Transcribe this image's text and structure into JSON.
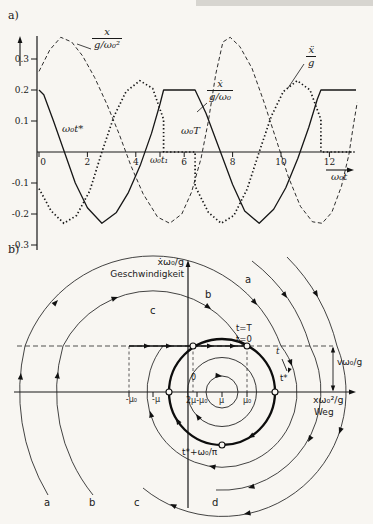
{
  "panel_a": {
    "tag": "a)",
    "curve1": {
      "num": "x",
      "den": "g/ω₀²"
    },
    "curve2": {
      "num": "ẋ",
      "den": "g/ω₀"
    },
    "curve3": {
      "num": "ẍ",
      "den": "g"
    },
    "t_star": "ω₀t*",
    "period": "ω₀T",
    "t1": "ω₀t₁",
    "time_axis": "ω₀t"
  },
  "panel_b": {
    "tag": "b)",
    "v_axis": "ẋω₀/g",
    "v_axis_word": "Geschwindigkeit",
    "x_axis": "xω₀²/g",
    "x_axis_word": "Weg",
    "v_level": "vω₀/g",
    "t_T": "t=T",
    "t_0": "t=0",
    "t_dir": "t",
    "t_star": "t*",
    "t_half": "t*+ω₀/π",
    "origin": "0",
    "x_ticks": {
      "m_mu0": "-μ₀",
      "m_mu": "-μ",
      "two_mu": "2μ-μ₀",
      "mu": "μ",
      "mu0": "μ₀"
    },
    "letters_top": [
      "a",
      "b",
      "c"
    ],
    "letters_bottom": [
      "a",
      "b",
      "c",
      "d"
    ]
  },
  "chart_data": [
    {
      "id": "a",
      "type": "line",
      "title": "Time histories of displacement, velocity and acceleration of a stick-slip friction oscillator",
      "x_axis": {
        "label": "ω₀t",
        "ticks": [
          0,
          2,
          4,
          6,
          8,
          10,
          12
        ],
        "range": [
          0,
          13.2
        ]
      },
      "y_axis": {
        "ticks": [
          0.3,
          0.2,
          0.1,
          -0.1,
          -0.2,
          -0.3
        ],
        "range": [
          -0.3,
          0.38
        ]
      },
      "annotations": {
        "t_star": "ω₀t*",
        "period": "ω₀T",
        "t1": "ω₀t₁",
        "t1_x": 5.0
      },
      "leaders": [
        [
          91,
          49,
          77,
          44
        ],
        [
          207,
          103,
          197,
          112
        ],
        [
          304,
          64,
          288,
          88
        ]
      ],
      "series": [
        {
          "name": "x/(g/ω₀²)",
          "style": "dashed",
          "points": [
            [
              0,
              0.26
            ],
            [
              0.45,
              0.33
            ],
            [
              0.9,
              0.37
            ],
            [
              1.35,
              0.355
            ],
            [
              1.8,
              0.31
            ],
            [
              2.3,
              0.24
            ],
            [
              2.8,
              0.155
            ],
            [
              3.3,
              0.06
            ],
            [
              3.8,
              -0.045
            ],
            [
              4.3,
              -0.135
            ],
            [
              4.9,
              -0.21
            ],
            [
              5.4,
              -0.23
            ],
            [
              5.9,
              -0.2
            ],
            [
              6.3,
              -0.13
            ],
            [
              6.7,
              -0.02
            ],
            [
              7.0,
              0.1
            ],
            [
              7.3,
              0.25
            ],
            [
              7.6,
              0.355
            ],
            [
              7.9,
              0.37
            ],
            [
              8.3,
              0.34
            ],
            [
              8.8,
              0.27
            ],
            [
              9.3,
              0.16
            ],
            [
              9.8,
              0.04
            ],
            [
              10.3,
              -0.08
            ],
            [
              10.8,
              -0.175
            ],
            [
              11.3,
              -0.225
            ],
            [
              11.7,
              -0.23
            ],
            [
              12.1,
              -0.195
            ],
            [
              12.5,
              -0.11
            ],
            [
              12.8,
              -0.01
            ],
            [
              13.0,
              0.09
            ],
            [
              13.15,
              0.16
            ]
          ]
        },
        {
          "name": "ẋ/(g/ω₀)",
          "style": "solid",
          "points": [
            [
              0,
              0.2
            ],
            [
              0.2,
              0.185
            ],
            [
              0.6,
              0.1
            ],
            [
              1.05,
              0.0
            ],
            [
              1.5,
              -0.1
            ],
            [
              2.0,
              -0.18
            ],
            [
              2.6,
              -0.23
            ],
            [
              3.2,
              -0.195
            ],
            [
              3.7,
              -0.13
            ],
            [
              4.2,
              -0.04
            ],
            [
              4.65,
              0.06
            ],
            [
              5.0,
              0.155
            ],
            [
              5.15,
              0.2
            ],
            [
              6.45,
              0.2
            ],
            [
              6.9,
              0.125
            ],
            [
              7.5,
              0.0
            ],
            [
              8.0,
              -0.105
            ],
            [
              8.5,
              -0.19
            ],
            [
              9.1,
              -0.23
            ],
            [
              9.7,
              -0.185
            ],
            [
              10.2,
              -0.115
            ],
            [
              10.7,
              -0.02
            ],
            [
              11.15,
              0.08
            ],
            [
              11.5,
              0.17
            ],
            [
              11.65,
              0.2
            ],
            [
              13.1,
              0.2
            ]
          ]
        },
        {
          "name": "ẍ/g",
          "style": "dotted",
          "points": [
            [
              0,
              -0.118
            ],
            [
              0.5,
              -0.19
            ],
            [
              1.03,
              -0.23
            ],
            [
              1.55,
              -0.205
            ],
            [
              2.1,
              -0.125
            ],
            [
              2.6,
              0.0
            ],
            [
              3.1,
              0.115
            ],
            [
              3.6,
              0.195
            ],
            [
              4.17,
              0.23
            ],
            [
              4.7,
              0.205
            ],
            [
              5.15,
              0.105
            ],
            [
              5.15,
              0.0
            ],
            [
              6.45,
              0.0
            ],
            [
              6.45,
              -0.11
            ],
            [
              7.0,
              -0.195
            ],
            [
              7.53,
              -0.23
            ],
            [
              8.05,
              -0.205
            ],
            [
              8.6,
              -0.12
            ],
            [
              9.1,
              0.0
            ],
            [
              9.6,
              0.115
            ],
            [
              10.1,
              0.195
            ],
            [
              10.67,
              0.23
            ],
            [
              11.2,
              0.2
            ],
            [
              11.65,
              0.105
            ],
            [
              11.65,
              0.0
            ],
            [
              13.1,
              0.0
            ]
          ]
        }
      ]
    },
    {
      "id": "b",
      "type": "phase-portrait",
      "title": "Phase plane: limit cycle of stick-slip oscillation with spiralling trajectories a–d",
      "axes": {
        "h": {
          "y": 137,
          "x1": 14,
          "x2": 352
        },
        "v": {
          "x": 188,
          "y1": 8,
          "y2": 253
        }
      },
      "stick_line": {
        "y": 91,
        "x1": 129,
        "x2": 247
      },
      "dashed_h": {
        "y": 91,
        "x1": 17,
        "x2": 333
      },
      "dashed_v": [
        129,
        193,
        247
      ],
      "tick_px": [
        129,
        153,
        197,
        222,
        247
      ],
      "t1_arrow": {
        "x1": 282,
        "y1": 104,
        "x2": 287,
        "y2": 116,
        "head": [
          288,
          118,
          112
        ]
      },
      "dim_arrow": {
        "x": 333,
        "y1": 91,
        "y2": 137
      },
      "limit_cycle": {
        "cx": 222,
        "cy": 137,
        "r": 53,
        "width": 2.3
      },
      "inner_loops": [
        16,
        34.5
      ],
      "markers": [
        [
          193,
          91
        ],
        [
          247,
          91
        ],
        [
          275,
          137
        ],
        [
          222,
          190
        ],
        [
          169,
          137
        ]
      ],
      "trajectories": [
        {
          "label": "a",
          "path": [
            [
              "M",
              48,
              240
            ],
            [
              "A",
              202,
              0,
              25,
              91
            ],
            [
              "A",
              136,
              0,
              281,
              91
            ],
            [
              "A",
              75,
              1,
              163,
              91
            ]
          ]
        },
        {
          "label": "b",
          "path": [
            [
              "M",
              93,
              240
            ],
            [
              "A",
              165,
              0,
              63,
              91
            ],
            [
              "A",
              101,
              0,
              243,
              91
            ]
          ]
        },
        {
          "label": "c",
          "path": [
            [
              "M",
              287,
              2
            ],
            [
              "A",
              190,
              0,
              337,
              91
            ],
            [
              "A",
              124,
              0,
              143,
              233
            ]
          ]
        },
        {
          "label": "d",
          "path": [
            [
              "M",
              252,
              6
            ],
            [
              "A",
              164,
              0,
              310,
              91
            ],
            [
              "A",
              99,
              0,
              216,
              235
            ]
          ]
        }
      ],
      "stick_arrows": [
        [
          150,
          91,
          0
        ],
        [
          172,
          91,
          0
        ],
        [
          213,
          91,
          0
        ],
        [
          236,
          91,
          0
        ]
      ],
      "arrows": [
        [
          21,
          118,
          275
        ],
        [
          58,
          45,
          314
        ],
        [
          257,
          50,
          50
        ],
        [
          292,
          111,
          70
        ],
        [
          209,
          211,
          190
        ],
        [
          150,
          156,
          255
        ],
        [
          58,
          117,
          277
        ],
        [
          118,
          42,
          340
        ],
        [
          211,
          54,
          35
        ],
        [
          318,
          42,
          60
        ],
        [
          339,
          179,
          110
        ],
        [
          244,
          259,
          170
        ],
        [
          170,
          249,
          205
        ],
        [
          287,
          43,
          55
        ],
        [
          308,
          187,
          120
        ],
        [
          248,
          233,
          165
        ],
        [
          252,
          94,
          35
        ],
        [
          248,
          183,
          150
        ],
        [
          176,
          163,
          240
        ],
        [
          222,
          121,
          5
        ],
        [
          196,
          159,
          235
        ]
      ]
    }
  ]
}
